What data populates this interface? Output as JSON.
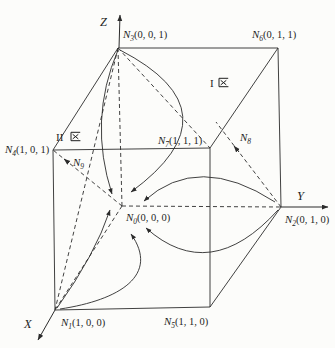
{
  "figure": {
    "background": "#fcfcfa",
    "line_color": "#2b2b2b",
    "axes": {
      "x": {
        "label": "X"
      },
      "y": {
        "label": "Y"
      },
      "z": {
        "label": "Z"
      }
    },
    "regions": {
      "region1": {
        "numeral": "I",
        "char": "区"
      },
      "region2": {
        "numeral": "II",
        "char": "区"
      }
    },
    "nodes": {
      "n0": {
        "sym": "N",
        "sub": "0",
        "coords": "(0, 0, 0)"
      },
      "n1": {
        "sym": "N",
        "sub": "1",
        "coords": "(1, 0, 0)"
      },
      "n2": {
        "sym": "N",
        "sub": "2",
        "coords": "(0, 1, 0)"
      },
      "n3": {
        "sym": "N",
        "sub": "3",
        "coords": "(0, 0, 1)"
      },
      "n4": {
        "sym": "N",
        "sub": "4",
        "coords": "(1, 0, 1)"
      },
      "n5": {
        "sym": "N",
        "sub": "5",
        "coords": "(1, 1, 0)"
      },
      "n6": {
        "sym": "N",
        "sub": "6",
        "coords": "(0, 1, 1)"
      },
      "n7": {
        "sym": "N",
        "sub": "7",
        "coords": "(1, 1, 1)"
      },
      "n8": {
        "sym": "N",
        "sub": "8",
        "coords": ""
      },
      "n9": {
        "sym": "N",
        "sub": "9",
        "coords": ""
      }
    }
  }
}
